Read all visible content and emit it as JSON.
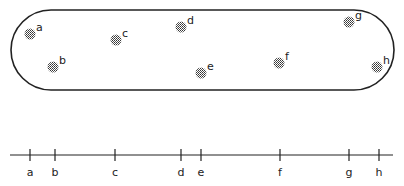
{
  "diagram": {
    "capsule": {
      "x": 11,
      "y": 10,
      "width": 383,
      "height": 80,
      "stroke": "#222222"
    },
    "points": [
      {
        "label": "a",
        "x": 30,
        "y": 34
      },
      {
        "label": "b",
        "x": 53,
        "y": 67
      },
      {
        "label": "c",
        "x": 116,
        "y": 40
      },
      {
        "label": "d",
        "x": 181,
        "y": 27
      },
      {
        "label": "e",
        "x": 201,
        "y": 73
      },
      {
        "label": "f",
        "x": 279,
        "y": 63
      },
      {
        "label": "g",
        "x": 349,
        "y": 22
      },
      {
        "label": "h",
        "x": 377,
        "y": 67
      }
    ],
    "axis": {
      "y": 155,
      "x_start": 10,
      "x_end": 393,
      "ticks": [
        {
          "label": "a",
          "x": 30
        },
        {
          "label": "b",
          "x": 55
        },
        {
          "label": "c",
          "x": 115
        },
        {
          "label": "d",
          "x": 181
        },
        {
          "label": "e",
          "x": 201
        },
        {
          "label": "f",
          "x": 280
        },
        {
          "label": "g",
          "x": 349
        },
        {
          "label": "h",
          "x": 379
        }
      ]
    }
  }
}
